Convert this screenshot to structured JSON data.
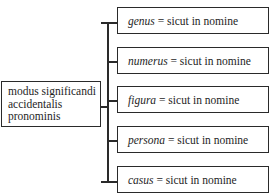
{
  "diagram": {
    "root": {
      "lines": [
        "modus significandi",
        "accidentalis",
        "pronominis"
      ]
    },
    "leaves": [
      {
        "term": "genus",
        "rest": " = sicut in nomine"
      },
      {
        "term": "numerus",
        "rest": " = sicut in nomine"
      },
      {
        "term": "figura",
        "rest": " = sicut in nomine"
      },
      {
        "term": "persona",
        "rest": " = sicut in nomine"
      },
      {
        "term": "casus",
        "rest": " = sicut in nomine"
      }
    ]
  }
}
